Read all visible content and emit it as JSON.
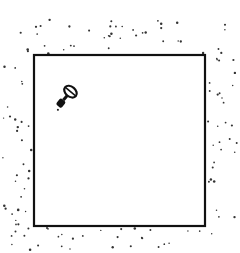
{
  "diagram": {
    "enclosure": {
      "shape": "square",
      "stroke": "#111111"
    },
    "inner_object": {
      "icon": "key-icon",
      "color": "#111111"
    },
    "particles": {
      "color": "#333333",
      "location": "outside-enclosure"
    }
  }
}
